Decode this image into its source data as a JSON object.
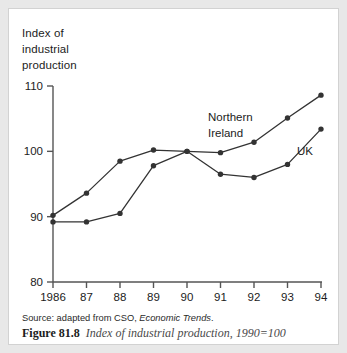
{
  "figure": {
    "axis_title_lines": [
      "Index of",
      "industrial",
      "production"
    ],
    "source_prefix": "Source: adapted from CSO, ",
    "source_italic": "Economic Trends",
    "source_suffix": ".",
    "caption_number": "Figure 81.8",
    "caption_text": "Index of industrial production, 1990=100"
  },
  "chart_data": {
    "type": "line",
    "title": "Index of industrial production",
    "xlabel": "",
    "ylabel": "Index of industrial production",
    "ylim": [
      80,
      110
    ],
    "yticks": [
      80,
      90,
      100,
      110
    ],
    "ytick_labels": [
      "80",
      "90",
      "100",
      "110"
    ],
    "grid": false,
    "legend_position": "inline-annotation",
    "note": "1990=100",
    "categories": [
      "1986",
      "87",
      "88",
      "89",
      "90",
      "91",
      "92",
      "93",
      "94"
    ],
    "x": [
      1986,
      1987,
      1988,
      1989,
      1990,
      1991,
      1992,
      1993,
      1994
    ],
    "series": [
      {
        "name": "Northern Ireland",
        "label_lines": [
          "Northern",
          "Ireland"
        ],
        "color": "#333333",
        "marker": "filled-circle",
        "values": [
          90.2,
          93.6,
          98.5,
          100.2,
          100.0,
          99.8,
          101.4,
          105.1,
          108.6
        ]
      },
      {
        "name": "UK",
        "label_lines": [
          "UK"
        ],
        "color": "#333333",
        "marker": "filled-circle",
        "values": [
          89.2,
          89.2,
          90.5,
          97.8,
          100.0,
          96.5,
          96.0,
          98.0,
          103.4
        ]
      }
    ]
  }
}
